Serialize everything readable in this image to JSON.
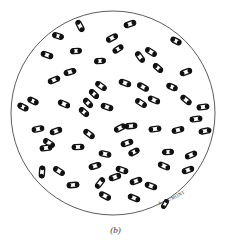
{
  "figure": {
    "caption": "(b)",
    "signature": "A. DUMONT",
    "background_color": "#ffffff",
    "circle_stroke_color": "#4a4a4a",
    "organism_outline_color": "#111111",
    "organism_fill_color": "#ffffff",
    "field": {
      "center_x": 113,
      "center_y": 113,
      "radius": 102
    },
    "organism_count": 61,
    "organism_shape": "elongated-oval-diplococcus",
    "organisms": [
      {
        "x": 80,
        "y": 26,
        "angle": -28,
        "len": 11,
        "wid": 5
      },
      {
        "x": 130,
        "y": 24,
        "angle": 72,
        "len": 11,
        "wid": 5
      },
      {
        "x": 112,
        "y": 38,
        "angle": 62,
        "len": 11,
        "wid": 5
      },
      {
        "x": 118,
        "y": 49,
        "angle": 58,
        "len": 10,
        "wid": 5
      },
      {
        "x": 176,
        "y": 41,
        "angle": -62,
        "len": 10,
        "wid": 5
      },
      {
        "x": 47,
        "y": 55,
        "angle": -72,
        "len": 11,
        "wid": 5
      },
      {
        "x": 76,
        "y": 51,
        "angle": 86,
        "len": 10,
        "wid": 5
      },
      {
        "x": 140,
        "y": 57,
        "angle": -36,
        "len": 11,
        "wid": 5
      },
      {
        "x": 151,
        "y": 52,
        "angle": -58,
        "len": 11,
        "wid": 5
      },
      {
        "x": 70,
        "y": 72,
        "angle": 74,
        "len": 11,
        "wid": 5
      },
      {
        "x": 54,
        "y": 80,
        "angle": 68,
        "len": 11,
        "wid": 5
      },
      {
        "x": 186,
        "y": 72,
        "angle": 70,
        "len": 11,
        "wid": 5
      },
      {
        "x": 101,
        "y": 86,
        "angle": -54,
        "len": 11,
        "wid": 5
      },
      {
        "x": 125,
        "y": 83,
        "angle": -70,
        "len": 11,
        "wid": 5
      },
      {
        "x": 143,
        "y": 87,
        "angle": -60,
        "len": 11,
        "wid": 5
      },
      {
        "x": 94,
        "y": 94,
        "angle": -46,
        "len": 10,
        "wid": 5
      },
      {
        "x": 88,
        "y": 103,
        "angle": -44,
        "len": 10,
        "wid": 5
      },
      {
        "x": 33,
        "y": 101,
        "angle": -64,
        "len": 10,
        "wid": 5
      },
      {
        "x": 23,
        "y": 107,
        "angle": -62,
        "len": 10,
        "wid": 5
      },
      {
        "x": 64,
        "y": 104,
        "angle": -66,
        "len": 11,
        "wid": 5
      },
      {
        "x": 84,
        "y": 112,
        "angle": -48,
        "len": 10,
        "wid": 5
      },
      {
        "x": 107,
        "y": 107,
        "angle": -72,
        "len": 11,
        "wid": 5
      },
      {
        "x": 141,
        "y": 103,
        "angle": -58,
        "len": 11,
        "wid": 5
      },
      {
        "x": 154,
        "y": 100,
        "angle": -66,
        "len": 11,
        "wid": 5
      },
      {
        "x": 186,
        "y": 100,
        "angle": -50,
        "len": 11,
        "wid": 5
      },
      {
        "x": 203,
        "y": 107,
        "angle": 84,
        "len": 11,
        "wid": 5
      },
      {
        "x": 38,
        "y": 129,
        "angle": 78,
        "len": 11,
        "wid": 5
      },
      {
        "x": 56,
        "y": 131,
        "angle": 70,
        "len": 11,
        "wid": 5
      },
      {
        "x": 49,
        "y": 143,
        "angle": -58,
        "len": 11,
        "wid": 5
      },
      {
        "x": 120,
        "y": 128,
        "angle": 64,
        "len": 11,
        "wid": 5
      },
      {
        "x": 89,
        "y": 134,
        "angle": -52,
        "len": 11,
        "wid": 5
      },
      {
        "x": 127,
        "y": 143,
        "angle": 72,
        "len": 11,
        "wid": 5
      },
      {
        "x": 134,
        "y": 152,
        "angle": 62,
        "len": 10,
        "wid": 5
      },
      {
        "x": 131,
        "y": 126,
        "angle": 86,
        "len": 11,
        "wid": 5
      },
      {
        "x": 155,
        "y": 129,
        "angle": 84,
        "len": 11,
        "wid": 5
      },
      {
        "x": 178,
        "y": 130,
        "angle": 76,
        "len": 11,
        "wid": 5
      },
      {
        "x": 205,
        "y": 131,
        "angle": 80,
        "len": 11,
        "wid": 5
      },
      {
        "x": 46,
        "y": 148,
        "angle": 84,
        "len": 11,
        "wid": 5
      },
      {
        "x": 78,
        "y": 147,
        "angle": 88,
        "len": 11,
        "wid": 5
      },
      {
        "x": 105,
        "y": 154,
        "angle": -78,
        "len": 11,
        "wid": 5
      },
      {
        "x": 168,
        "y": 152,
        "angle": 88,
        "len": 10,
        "wid": 5
      },
      {
        "x": 191,
        "y": 155,
        "angle": 66,
        "len": 11,
        "wid": 5
      },
      {
        "x": 42,
        "y": 172,
        "angle": 4,
        "len": 11,
        "wid": 5
      },
      {
        "x": 59,
        "y": 171,
        "angle": -58,
        "len": 11,
        "wid": 5
      },
      {
        "x": 95,
        "y": 166,
        "angle": 74,
        "len": 11,
        "wid": 5
      },
      {
        "x": 122,
        "y": 170,
        "angle": -72,
        "len": 11,
        "wid": 5
      },
      {
        "x": 164,
        "y": 166,
        "angle": -66,
        "len": 11,
        "wid": 5
      },
      {
        "x": 188,
        "y": 170,
        "angle": 70,
        "len": 11,
        "wid": 5
      },
      {
        "x": 73,
        "y": 185,
        "angle": 86,
        "len": 11,
        "wid": 5
      },
      {
        "x": 100,
        "y": 183,
        "angle": 38,
        "len": 11,
        "wid": 5
      },
      {
        "x": 115,
        "y": 177,
        "angle": 70,
        "len": 11,
        "wid": 5
      },
      {
        "x": 136,
        "y": 181,
        "angle": 72,
        "len": 11,
        "wid": 5
      },
      {
        "x": 151,
        "y": 186,
        "angle": -70,
        "len": 11,
        "wid": 5
      },
      {
        "x": 105,
        "y": 196,
        "angle": -62,
        "len": 11,
        "wid": 5
      },
      {
        "x": 134,
        "y": 198,
        "angle": -68,
        "len": 11,
        "wid": 5
      },
      {
        "x": 196,
        "y": 119,
        "angle": 82,
        "len": 11,
        "wid": 5
      },
      {
        "x": 158,
        "y": 68,
        "angle": -48,
        "len": 10,
        "wid": 5
      },
      {
        "x": 58,
        "y": 36,
        "angle": -74,
        "len": 10,
        "wid": 5
      },
      {
        "x": 100,
        "y": 61,
        "angle": 86,
        "len": 10,
        "wid": 5
      },
      {
        "x": 172,
        "y": 87,
        "angle": -66,
        "len": 10,
        "wid": 5
      },
      {
        "x": 165,
        "y": 204,
        "angle": 30,
        "len": 9,
        "wid": 4
      }
    ]
  }
}
